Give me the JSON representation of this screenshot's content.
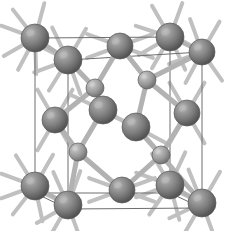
{
  "figure": {
    "title": "Diamond cubic crystal structure unit cell",
    "alt_label": "diamond-cubic-unit-cell",
    "width": 239,
    "height": 231,
    "background_color": "#ffffff",
    "style": "ball-and-stick 3D perspective render, grayscale"
  },
  "palette": {
    "background": "#ffffff",
    "cell_edge": "#6e6e6e",
    "bond_fill": "#b2b2b2",
    "bond_edge": "#8f8f8f",
    "stub_fill": "#c0c0c0",
    "atom_large_base": "#7b7b7b",
    "atom_large_highlight": "#b9b9b9",
    "atom_large_shadow": "#4c4c4c",
    "atom_small_base": "#9b9b9b",
    "atom_small_highlight": "#cfcfcf",
    "atom_small_shadow": "#6a6a6a",
    "atom_outline": "#5a5a5a"
  },
  "unit_cell": {
    "shape": "cube",
    "projection": "oblique",
    "vertices": {
      "front_top_left": [
        35,
        38
      ],
      "front_top_right": [
        170,
        37
      ],
      "front_bottom_left": [
        35,
        193
      ],
      "front_bottom_right": [
        170,
        193
      ],
      "back_top_left": [
        68,
        60
      ],
      "back_top_right": [
        202,
        52
      ],
      "back_bottom_left": [
        68,
        209
      ],
      "back_bottom_right": [
        202,
        208
      ]
    },
    "edges": [
      [
        "front_top_left",
        "front_top_right"
      ],
      [
        "front_top_right",
        "front_bottom_right"
      ],
      [
        "front_bottom_right",
        "front_bottom_left"
      ],
      [
        "front_bottom_left",
        "front_top_left"
      ],
      [
        "back_top_left",
        "back_top_right"
      ],
      [
        "back_top_right",
        "back_bottom_right"
      ],
      [
        "back_bottom_right",
        "back_bottom_left"
      ],
      [
        "back_bottom_left",
        "back_top_left"
      ],
      [
        "front_top_left",
        "back_top_left"
      ],
      [
        "front_top_right",
        "back_top_right"
      ],
      [
        "front_bottom_left",
        "back_bottom_left"
      ],
      [
        "front_bottom_right",
        "back_bottom_right"
      ]
    ]
  },
  "atoms": [
    {
      "id": "corner-front-top-left",
      "role": "corner",
      "x": 35,
      "y": 38,
      "r": 14,
      "size": "large"
    },
    {
      "id": "corner-back-top-left",
      "role": "corner",
      "x": 68,
      "y": 60,
      "r": 14,
      "size": "large"
    },
    {
      "id": "corner-front-top-right",
      "role": "corner",
      "x": 170,
      "y": 37,
      "r": 14,
      "size": "large"
    },
    {
      "id": "corner-back-top-right",
      "role": "corner",
      "x": 202,
      "y": 52,
      "r": 13,
      "size": "large"
    },
    {
      "id": "corner-front-bottom-left",
      "role": "corner",
      "x": 35,
      "y": 186,
      "r": 14,
      "size": "large"
    },
    {
      "id": "corner-back-bottom-left",
      "role": "corner",
      "x": 68,
      "y": 205,
      "r": 14,
      "size": "large"
    },
    {
      "id": "corner-front-bottom-right",
      "role": "corner",
      "x": 170,
      "y": 185,
      "r": 14,
      "size": "large"
    },
    {
      "id": "corner-back-bottom-right",
      "role": "corner",
      "x": 202,
      "y": 203,
      "r": 14,
      "size": "large"
    },
    {
      "id": "face-top",
      "role": "face-center",
      "x": 120,
      "y": 46,
      "r": 13,
      "size": "large"
    },
    {
      "id": "face-bottom",
      "role": "face-center",
      "x": 122,
      "y": 190,
      "r": 13,
      "size": "large"
    },
    {
      "id": "face-left",
      "role": "face-center",
      "x": 55,
      "y": 120,
      "r": 13,
      "size": "large"
    },
    {
      "id": "face-right",
      "role": "face-center",
      "x": 187,
      "y": 113,
      "r": 13,
      "size": "large"
    },
    {
      "id": "face-front",
      "role": "face-center",
      "x": 103,
      "y": 110,
      "r": 14,
      "size": "large"
    },
    {
      "id": "face-back",
      "role": "face-center",
      "x": 136,
      "y": 127,
      "r": 14,
      "size": "large"
    },
    {
      "id": "interior-upper-right",
      "role": "interior",
      "x": 147,
      "y": 80,
      "r": 9,
      "size": "small"
    },
    {
      "id": "interior-upper-left",
      "role": "interior",
      "x": 95,
      "y": 88,
      "r": 9,
      "size": "small"
    },
    {
      "id": "interior-lower-left",
      "role": "interior",
      "x": 78,
      "y": 152,
      "r": 9,
      "size": "small"
    },
    {
      "id": "interior-lower-right",
      "role": "interior",
      "x": 161,
      "y": 155,
      "r": 9,
      "size": "small"
    }
  ],
  "bonds": [
    {
      "from": "corner-front-top-left",
      "to": "corner-back-top-left",
      "width": 4
    },
    {
      "from": "corner-front-bottom-left",
      "to": "corner-back-bottom-left",
      "width": 4
    },
    {
      "from": "corner-front-top-right",
      "to": "corner-back-top-right",
      "width": 4
    },
    {
      "from": "corner-front-bottom-right",
      "to": "corner-back-bottom-right",
      "width": 4
    },
    {
      "from": "interior-upper-right",
      "to": "corner-back-top-right",
      "width": 5
    },
    {
      "from": "interior-upper-right",
      "to": "face-top",
      "width": 5
    },
    {
      "from": "interior-upper-right",
      "to": "face-right",
      "width": 5
    },
    {
      "from": "interior-upper-right",
      "to": "face-back",
      "width": 5
    },
    {
      "from": "interior-upper-left",
      "to": "corner-back-top-left",
      "width": 5
    },
    {
      "from": "interior-upper-left",
      "to": "face-top",
      "width": 5
    },
    {
      "from": "interior-upper-left",
      "to": "face-left",
      "width": 5
    },
    {
      "from": "interior-upper-left",
      "to": "face-front",
      "width": 5
    },
    {
      "from": "interior-lower-left",
      "to": "corner-back-bottom-left",
      "width": 5
    },
    {
      "from": "interior-lower-left",
      "to": "face-left",
      "width": 5
    },
    {
      "from": "interior-lower-left",
      "to": "face-front",
      "width": 5
    },
    {
      "from": "interior-lower-left",
      "to": "face-bottom",
      "width": 5
    },
    {
      "from": "interior-lower-right",
      "to": "corner-back-bottom-right",
      "width": 5
    },
    {
      "from": "interior-lower-right",
      "to": "face-right",
      "width": 5
    },
    {
      "from": "interior-lower-right",
      "to": "face-back",
      "width": 5
    },
    {
      "from": "interior-lower-right",
      "to": "face-bottom",
      "width": 5
    }
  ],
  "stub_bonds": {
    "description": "Short dangling half-bonds radiating from peripheral atoms to indicate continuation of the lattice",
    "length": 22,
    "width": 4,
    "items": [
      {
        "atom": "corner-front-top-left",
        "angles": [
          200,
          232,
          150,
          118,
          285,
          88
        ]
      },
      {
        "atom": "corner-back-top-left",
        "angles": [
          206,
          244,
          160,
          122,
          300,
          70
        ]
      },
      {
        "atom": "corner-front-top-right",
        "angles": [
          198,
          240,
          150,
          120,
          290,
          65
        ]
      },
      {
        "atom": "corner-back-top-right",
        "angles": [
          210,
          250,
          160,
          118,
          300,
          55
        ]
      },
      {
        "atom": "corner-front-bottom-left",
        "angles": [
          160,
          128,
          200,
          238,
          78,
          300
        ]
      },
      {
        "atom": "corner-back-bottom-left",
        "angles": [
          150,
          120,
          206,
          246,
          70,
          290
        ]
      },
      {
        "atom": "corner-front-bottom-right",
        "angles": [
          160,
          125,
          200,
          240,
          75,
          295
        ]
      },
      {
        "atom": "corner-back-bottom-right",
        "angles": [
          155,
          120,
          205,
          248,
          70,
          300
        ]
      },
      {
        "atom": "face-top",
        "angles": [
          160,
          200,
          340,
          20
        ]
      },
      {
        "atom": "face-bottom",
        "angles": [
          160,
          200,
          340,
          20
        ]
      },
      {
        "atom": "face-left",
        "angles": [
          120,
          60,
          240,
          300
        ]
      },
      {
        "atom": "face-right",
        "angles": [
          120,
          60,
          240,
          300
        ]
      },
      {
        "atom": "face-front",
        "angles": [
          28,
          205
        ]
      },
      {
        "atom": "face-back",
        "angles": [
          28,
          205
        ]
      }
    ]
  }
}
